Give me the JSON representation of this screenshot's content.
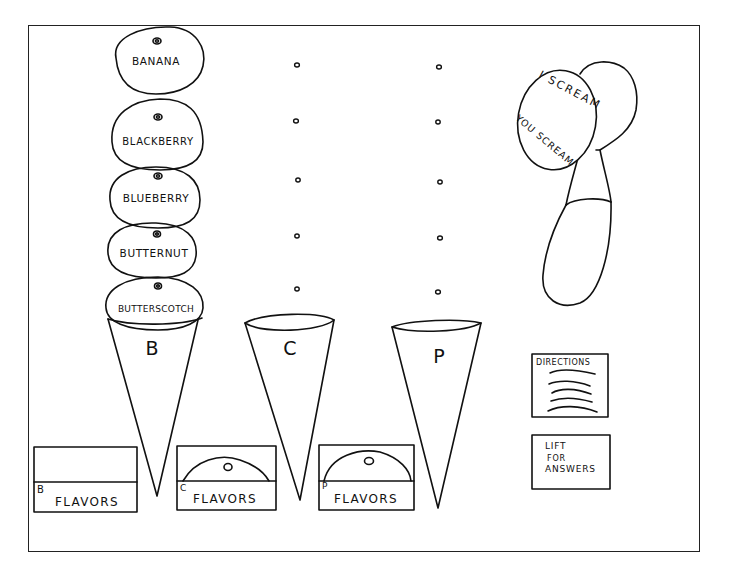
{
  "scoops": [
    {
      "label": "BANANA",
      "cx": 156,
      "cy": 59
    },
    {
      "label": "BLACKBERRY",
      "cx": 157,
      "cy": 141
    },
    {
      "label": "BLUEBERRY",
      "cx": 156,
      "cy": 197
    },
    {
      "label": "BUTTERNUT",
      "cx": 155,
      "cy": 252
    },
    {
      "label": "BUTTERSCOTCH",
      "cx": 157,
      "cy": 308
    }
  ],
  "cones": [
    {
      "letter": "B",
      "x": 152,
      "y": 347
    },
    {
      "letter": "C",
      "x": 290,
      "y": 347
    },
    {
      "letter": "P",
      "x": 439,
      "y": 356
    }
  ],
  "empty_slots": {
    "column_c": [
      [
        297,
        65
      ],
      [
        296,
        121
      ],
      [
        298,
        180
      ],
      [
        297,
        236
      ],
      [
        297,
        289
      ]
    ],
    "column_p": [
      [
        439,
        67
      ],
      [
        438,
        122
      ],
      [
        440,
        182
      ],
      [
        440,
        238
      ],
      [
        438,
        292
      ]
    ]
  },
  "flavor_boxes": [
    {
      "letter": "B",
      "word": "FLAVORS",
      "has_scoop": false
    },
    {
      "letter": "C",
      "word": "FLAVORS",
      "has_scoop": true
    },
    {
      "letter": "P",
      "word": "FLAVORS",
      "has_scoop": true
    }
  ],
  "scooper": {
    "line1": "I SCREAM",
    "line2": "YOU SCREAM"
  },
  "directions": {
    "title": "DIRECTIONS"
  },
  "answers": {
    "line1": "LIFT",
    "line2": "FOR",
    "line3": "ANSWERS"
  },
  "colors": {
    "ink": "#111111",
    "paper": "#ffffff"
  }
}
